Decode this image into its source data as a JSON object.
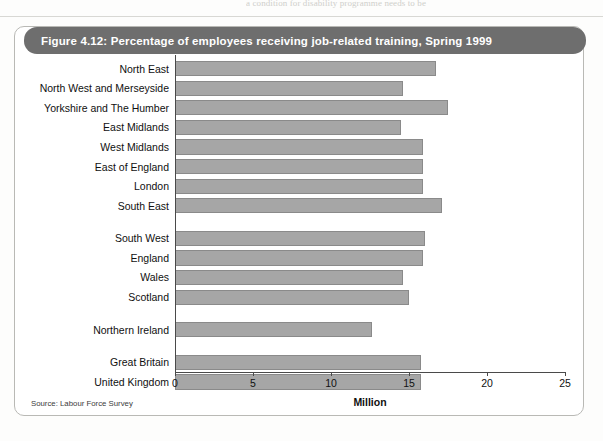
{
  "page": {
    "bleed_text_top": "a condition for disability programme needs to be",
    "bleed_text_mid": "",
    "source_note": "Source: Labour Force Survey"
  },
  "figure": {
    "title": "Figure 4.12: Percentage of employees receiving job-related training, Spring 1999",
    "header_color": "#6e6e6e",
    "bar_color": "#a6a6a6",
    "bar_border_color": "#8a8a8a"
  },
  "chart_data": {
    "type": "bar",
    "orientation": "horizontal",
    "title": "Figure 4.12: Percentage of employees receiving job-related training, Spring 1999",
    "xlabel": "Million",
    "ylabel": "",
    "xlim": [
      0,
      25
    ],
    "xticks": [
      0,
      5,
      10,
      15,
      20,
      25
    ],
    "xtick_labels": [
      "0",
      "5",
      "10",
      "15",
      "20",
      "25"
    ],
    "grid": false,
    "legend": false,
    "categories": [
      "North East",
      "North West and Merseyside",
      "Yorkshire and The Humber",
      "East Midlands",
      "West Midlands",
      "East of England",
      "London",
      "South East",
      "South West",
      "England",
      "Wales",
      "Scotland",
      "Northern Ireland",
      "Great Britain",
      "United Kingdom"
    ],
    "values": [
      16.7,
      14.6,
      17.5,
      14.5,
      15.9,
      15.9,
      15.9,
      17.1,
      16.0,
      15.9,
      14.6,
      15.0,
      12.6,
      15.8,
      15.8
    ],
    "groups": [
      {
        "name": "English regions",
        "categories": [
          "North East",
          "North West and Merseyside",
          "Yorkshire and The Humber",
          "East Midlands",
          "West Midlands",
          "East of England",
          "London",
          "South East",
          "South West"
        ]
      },
      {
        "name": "Countries",
        "categories": [
          "England",
          "Wales",
          "Scotland",
          "Northern Ireland"
        ]
      },
      {
        "name": "Great Britain",
        "categories": [
          "Great Britain"
        ]
      },
      {
        "name": "United Kingdom",
        "categories": [
          "United Kingdom"
        ]
      }
    ],
    "source": "Source: Labour Force Survey"
  }
}
